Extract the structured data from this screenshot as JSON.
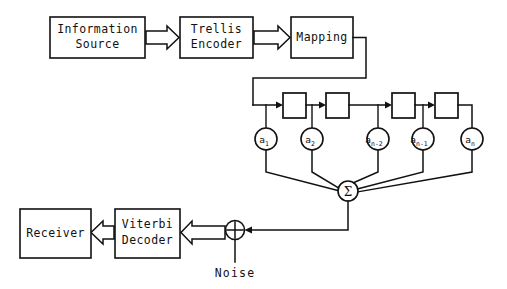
{
  "diagram": {
    "colors": {
      "line": "#111111",
      "background": "#ffffff",
      "fill": "#ffffff"
    },
    "blocks": [
      {
        "id": "information-source",
        "label_line1": "Information",
        "label_line2": "Source",
        "x": 50,
        "y": 17,
        "w": 95,
        "h": 41
      },
      {
        "id": "trellis-encoder",
        "label_line1": "Trellis",
        "label_line2": "Encoder",
        "x": 180,
        "y": 17,
        "w": 73,
        "h": 41
      },
      {
        "id": "mapping",
        "label_line1": "Mapping",
        "label_line2": "",
        "x": 291,
        "y": 17,
        "w": 62,
        "h": 41
      },
      {
        "id": "viterbi-decoder",
        "label_line1": "Viterbi",
        "label_line2": "Decoder",
        "x": 115,
        "y": 209,
        "w": 65,
        "h": 49
      },
      {
        "id": "receiver",
        "label_line1": "Receiver",
        "label_line2": "",
        "x": 20,
        "y": 209,
        "w": 71,
        "h": 49
      }
    ],
    "delay_elements": [
      {
        "id": "delay-1",
        "x": 283,
        "y": 93,
        "w": 23,
        "h": 25
      },
      {
        "id": "delay-2",
        "x": 326,
        "y": 93,
        "w": 23,
        "h": 25
      },
      {
        "id": "delay-3",
        "x": 392,
        "y": 93,
        "w": 23,
        "h": 25
      },
      {
        "id": "delay-4",
        "x": 435,
        "y": 93,
        "w": 23,
        "h": 25
      }
    ],
    "tap_coefficients": [
      {
        "id": "tap-a1",
        "base": "a",
        "subscript": "1",
        "cx": 266,
        "cy": 139,
        "r": 11
      },
      {
        "id": "tap-a2",
        "base": "a",
        "subscript": "2",
        "cx": 312,
        "cy": 139,
        "r": 11
      },
      {
        "id": "tap-a-n-minus-2",
        "base": "a",
        "subscript": "n-2",
        "cx": 378,
        "cy": 139,
        "r": 11
      },
      {
        "id": "tap-a-n-minus-1",
        "base": "a",
        "subscript": "n-1",
        "cx": 423,
        "cy": 139,
        "r": 11
      },
      {
        "id": "tap-an",
        "base": "a",
        "subscript": "n",
        "cx": 472,
        "cy": 139,
        "r": 11
      }
    ],
    "summation_node": {
      "id": "summation",
      "symbol": "Σ",
      "cx": 348,
      "cy": 191,
      "r": 10
    },
    "adder_node": {
      "id": "noise-adder",
      "symbol": "+",
      "cx": 235,
      "cy": 230,
      "r": 9.5
    },
    "labels": {
      "noise": "Noise"
    },
    "arrows": [
      {
        "id": "arrow-source-to-encoder",
        "style": "hollow-block",
        "from": "information-source",
        "to": "trellis-encoder"
      },
      {
        "id": "arrow-encoder-to-mapping",
        "style": "hollow-block",
        "from": "trellis-encoder",
        "to": "mapping"
      },
      {
        "id": "arrow-adder-to-decoder",
        "style": "hollow-block",
        "from": "noise-adder",
        "to": "viterbi-decoder"
      },
      {
        "id": "arrow-decoder-to-receiver",
        "style": "hollow-block",
        "from": "viterbi-decoder",
        "to": "receiver"
      }
    ]
  }
}
